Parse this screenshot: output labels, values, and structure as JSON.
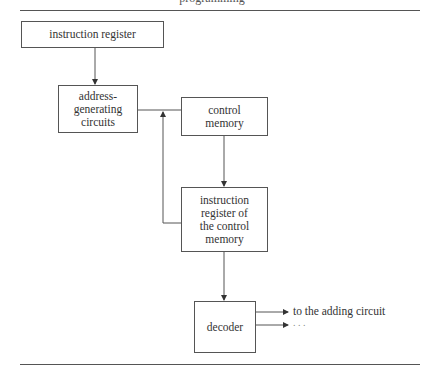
{
  "page_header": "programming",
  "diagram": {
    "boxes": {
      "instruction_register": {
        "label": "instruction register"
      },
      "address_generating": {
        "lines": [
          "address-",
          "generating",
          "circuits"
        ]
      },
      "control_memory": {
        "lines": [
          "control",
          "memory"
        ]
      },
      "ir_control_memory": {
        "lines": [
          "instruction",
          "register of",
          "the control",
          "memory"
        ]
      },
      "decoder": {
        "label": "decoder"
      }
    },
    "outputs": [
      {
        "label": "to the adding circuit"
      },
      {
        "label": ". . ."
      }
    ],
    "edges": [
      {
        "from": "instruction register",
        "to": "address-generating circuits"
      },
      {
        "from": "address-generating circuits",
        "to": "control memory"
      },
      {
        "from": "control memory",
        "to": "instruction register of the control memory"
      },
      {
        "from": "instruction register of the control memory",
        "to": "address-generating circuits",
        "type": "feedback"
      },
      {
        "from": "instruction register of the control memory",
        "to": "decoder"
      },
      {
        "from": "decoder",
        "to": "to the adding circuit"
      },
      {
        "from": "decoder",
        "to": ". . ."
      }
    ],
    "line_color": "#555555"
  }
}
